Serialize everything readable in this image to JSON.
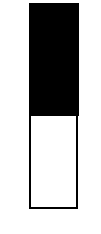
{
  "gauge": {
    "orientation": "vertical",
    "filled_fraction_from_top": 0.55,
    "colors": {
      "filled": "#000000",
      "empty": "#ffffff",
      "border": "#000000",
      "background": "#ffffff"
    }
  }
}
